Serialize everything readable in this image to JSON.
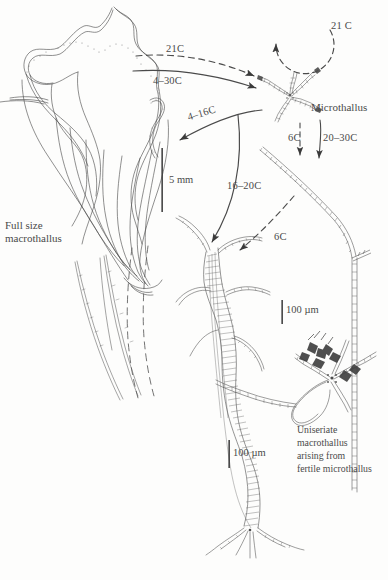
{
  "figure": {
    "type": "life-cycle-diagram",
    "background_color": "#fdfdfc",
    "ink_color": "#3a3a3a"
  },
  "stages": [
    {
      "id": "full-size-macrothallus",
      "label": "Full size\nmacrothallus",
      "label_lines": [
        "Full size",
        "macrothallus"
      ],
      "position": "upper-left"
    },
    {
      "id": "microthallus",
      "label": "Microthallus",
      "position": "upper-right"
    },
    {
      "id": "multiseriate-macrothallus",
      "label": "",
      "position": "bottom-center"
    },
    {
      "id": "uniseriate-macrothallus",
      "label": "Uniseriate\nmacrothallus\narising from\nfertile microthallus",
      "label_lines": [
        "Uniseriate",
        "macrothallus",
        "arising from",
        "fertile microthallus"
      ],
      "position": "lower-right"
    }
  ],
  "transitions": [
    {
      "id": "t-micro-self",
      "label": "21 C",
      "style": "dashed",
      "note": "circular self-loop above microthallus"
    },
    {
      "id": "t-macro-micro-a",
      "label": "21C",
      "style": "dashed",
      "note": "macrothallus to microthallus"
    },
    {
      "id": "t-macro-micro-b",
      "label": "4–30C",
      "style": "solid",
      "note": "macrothallus to microthallus"
    },
    {
      "id": "t-micro-macro",
      "label": "4–16C",
      "style": "solid",
      "note": "microthallus back to macrothallus"
    },
    {
      "id": "t-micro-uni-a",
      "label": "6C",
      "style": "dashed",
      "note": "microthallus to uniseriate filament"
    },
    {
      "id": "t-micro-uni-b",
      "label": "20–30C",
      "style": "solid",
      "note": "microthallus to uniseriate filament"
    },
    {
      "id": "t-micro-multi",
      "label": "16–20C",
      "style": "solid",
      "note": "microthallus to multiseriate macrothallus"
    },
    {
      "id": "t-uni-multi",
      "label": "6C",
      "style": "dashed",
      "note": "uniseriate filament to multiseriate macrothallus"
    }
  ],
  "scale_bars": [
    {
      "id": "scale-macrothallus",
      "label": "5 mm",
      "orientation": "vertical"
    },
    {
      "id": "scale-multiseriate",
      "label": "100 µm",
      "orientation": "vertical"
    },
    {
      "id": "scale-uniseriate",
      "label": "100 µm",
      "orientation": "vertical"
    }
  ],
  "labels": {
    "full_size_line1": "Full size",
    "full_size_line2": "macrothallus",
    "microthallus": "Microthallus",
    "temp_loop": "21 C",
    "temp_21c": "21C",
    "temp_4_30c": "4–30C",
    "temp_4_16c": "4–16C",
    "temp_6c_upper": "6C",
    "temp_20_30c": "20–30C",
    "temp_16_20c": "16–20C",
    "temp_6c_lower": "6C",
    "scale_5mm": "5 mm",
    "scale_100um_center": "100 µm",
    "scale_100um_right": "100 µm",
    "caption_line1": "Uniseriate",
    "caption_line2": "macrothallus",
    "caption_line3": "arising from",
    "caption_line4": "fertile microthallus"
  }
}
